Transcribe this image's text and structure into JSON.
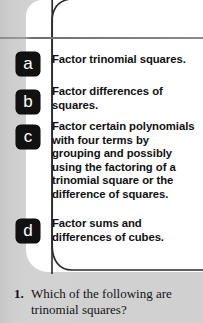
{
  "panel": {
    "title": "Objectives",
    "objectives": [
      {
        "letter": "a",
        "text": "Factor trinomial squares."
      },
      {
        "letter": "b",
        "text": "Factor differences of squares."
      },
      {
        "letter": "c",
        "text": "Factor certain polynomials with four terms by grouping and possibly using the factoring of a trinomial square or the difference of squares."
      },
      {
        "letter": "d",
        "text": "Factor sums and differences of cubes."
      }
    ]
  },
  "exercise": {
    "number": "1.",
    "text": "Which of the following are trinomial squares?"
  },
  "colors": {
    "page_background": "#cfcfcf",
    "panel_background": "#ffffff",
    "badge_background": "#111111",
    "badge_text": "#ffffff",
    "rule": "#8a8a8a",
    "body_text": "#141414"
  }
}
